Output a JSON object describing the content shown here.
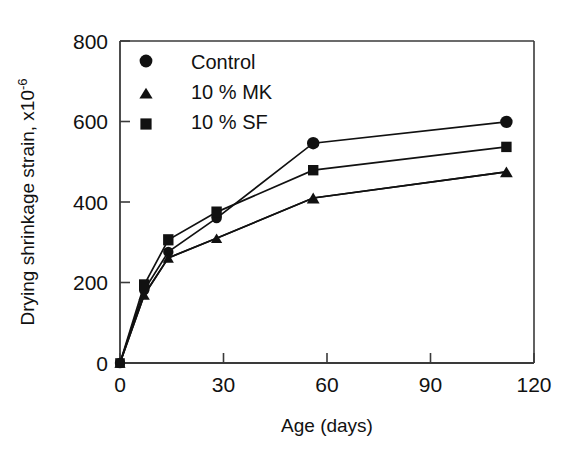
{
  "chart_data": {
    "type": "line",
    "title": "",
    "subtitle": "",
    "xlabel": "Age (days)",
    "ylabel": "Drying shrinkage strain, x10",
    "ylabel_exponent": "-6",
    "xlim": [
      0,
      120
    ],
    "ylim": [
      0,
      800
    ],
    "xticks": [
      0,
      30,
      60,
      90,
      120
    ],
    "yticks": [
      0,
      200,
      400,
      600,
      800
    ],
    "xticklabels": [
      "0",
      "30",
      "60",
      "90",
      "120"
    ],
    "yticklabels": [
      "0",
      "200",
      "400",
      "600",
      "800"
    ],
    "grid": false,
    "legend_position": "upper-left-inside",
    "x": [
      0,
      7,
      14,
      28,
      56,
      112
    ],
    "series": [
      {
        "name": "Control",
        "marker": "circle",
        "color": "#111111",
        "values": [
          0,
          181,
          276,
          360,
          546,
          599
        ]
      },
      {
        "name": "10 % MK",
        "marker": "triangle",
        "color": "#111111",
        "values": [
          0,
          169,
          261,
          310,
          410,
          475
        ]
      },
      {
        "name": "10 % SF",
        "marker": "square",
        "color": "#111111",
        "values": [
          0,
          194,
          306,
          375,
          479,
          537
        ]
      }
    ]
  },
  "legend": {
    "items": [
      {
        "label": "Control",
        "marker": "circle"
      },
      {
        "label": "10 % MK",
        "marker": "triangle"
      },
      {
        "label": "10 % SF",
        "marker": "square"
      }
    ]
  },
  "axes": {
    "x_title": "Age (days)",
    "y_title_main": "Drying shrinkage strain, x10",
    "y_title_sup": "-6",
    "x_tick_0": "0",
    "x_tick_1": "30",
    "x_tick_2": "60",
    "x_tick_3": "90",
    "x_tick_4": "120",
    "y_tick_0": "0",
    "y_tick_1": "200",
    "y_tick_2": "400",
    "y_tick_3": "600",
    "y_tick_4": "800"
  },
  "style": {
    "ink": "#111111",
    "background": "#ffffff"
  }
}
